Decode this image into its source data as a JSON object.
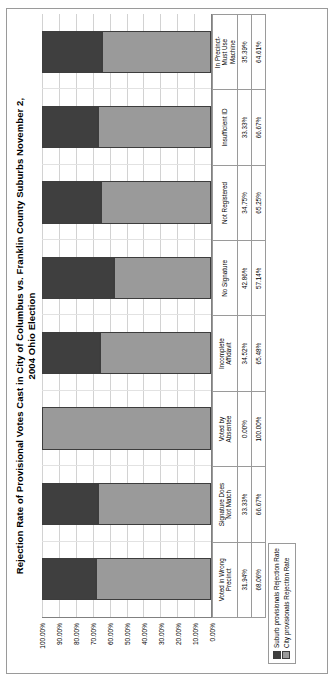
{
  "chart_data": {
    "type": "bar",
    "subtype": "stacked-column-100",
    "title": "Rejection Rate of Provisional Votes Cast in City of Columbus vs. Franklin County Suburbs November 2, 2004 Ohio Election",
    "xlabel": "",
    "ylabel": "",
    "ylim": [
      0,
      100
    ],
    "ytick_suffix": "%",
    "grid": true,
    "legend_position": "bottom-left",
    "categories": [
      "Voted in Wrong Precinct",
      "Signature Does Not Match",
      "Voted by Absentee",
      "Incomplete Affidavit",
      "No Signature",
      "Not Registered",
      "Insufficient ID",
      "In Precinct- Must Use Machine"
    ],
    "yticks": [
      "100.00%",
      "90.00%",
      "80.00%",
      "70.00%",
      "60.00%",
      "50.00%",
      "40.00%",
      "30.00%",
      "20.00%",
      "10.00%",
      "0.00%"
    ],
    "ytick_values": [
      100,
      90,
      80,
      70,
      60,
      50,
      40,
      30,
      20,
      10,
      0
    ],
    "series": [
      {
        "name": "Suburb provisionals Rejection Rate",
        "color": "#3f3f3f",
        "values": [
          31.94,
          33.33,
          0.0,
          34.52,
          42.86,
          34.75,
          33.33,
          35.39
        ],
        "labels": [
          "31.94%",
          "33.33%",
          "0.00%",
          "34.52%",
          "42.86%",
          "34.75%",
          "33.33%",
          "35.39%"
        ]
      },
      {
        "name": "City provisionals Rejection Rate",
        "color": "#9a9a9a",
        "values": [
          68.06,
          66.67,
          100.0,
          65.48,
          57.14,
          65.25,
          66.67,
          64.61
        ],
        "labels": [
          "68.06%",
          "66.67%",
          "100.00%",
          "65.48%",
          "57.14%",
          "65.25%",
          "66.67%",
          "64.61%"
        ]
      }
    ]
  },
  "title": {
    "line1": "Rejection Rate of Provisional Votes Cast in City of Columbus vs. Franklin County Suburbs November 2,",
    "line2": "2004 Ohio Election"
  },
  "legend": {
    "items": [
      {
        "label": "Suburb provisionals Rejection Rate",
        "swatch": "#3f3f3f"
      },
      {
        "label": "City provisionals Rejection Rate",
        "swatch": "#9a9a9a"
      }
    ]
  },
  "data_table": {
    "row_headers": [
      "Suburb provisionals Rejection Rate",
      "City provisionals Rejection Rate"
    ],
    "columns": [
      {
        "header": "Voted in Wrong Precinct",
        "header_line1": "Voted in Wrong",
        "header_line2": "Precinct",
        "suburb": "31.94%",
        "city": "68.06%"
      },
      {
        "header": "Signature Does Not Match",
        "header_line1": "Signature Does",
        "header_line2": "Not Match",
        "suburb": "33.33%",
        "city": "66.67%"
      },
      {
        "header": "Voted by Absentee",
        "header_line1": "Voted by",
        "header_line2": "Absentee",
        "suburb": "0.00%",
        "city": "100.00%"
      },
      {
        "header": "Incomplete Affidavit",
        "header_line1": "Incomplete",
        "header_line2": "Affidavit",
        "suburb": "34.52%",
        "city": "65.48%"
      },
      {
        "header": "No Signature",
        "header_line1": "No Signature",
        "header_line2": "",
        "suburb": "42.86%",
        "city": "57.14%"
      },
      {
        "header": "Not Registered",
        "header_line1": "Not Registered",
        "header_line2": "",
        "suburb": "34.75%",
        "city": "65.25%"
      },
      {
        "header": "Insufficient ID",
        "header_line1": "Insufficient ID",
        "header_line2": "",
        "suburb": "33.33%",
        "city": "66.67%"
      },
      {
        "header": "In Precinct- Must Use Machine",
        "header_line1": "In Precinct-",
        "header_line2": "Must Use",
        "header_line3": "Machine",
        "suburb": "35.39%",
        "city": "64.61%"
      }
    ]
  },
  "colors": {
    "suburb": "#3f3f3f",
    "city": "#9a9a9a",
    "gridline": "#d2d2d2",
    "axis": "#808080",
    "border": "#9a9a9a"
  }
}
